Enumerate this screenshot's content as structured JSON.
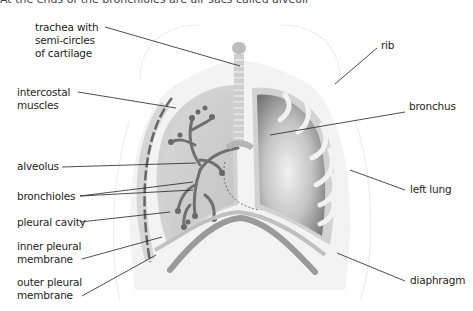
{
  "caption": "At the ends of the bronchioles are air sacs called alveoli",
  "labels": {
    "trachea": [
      "trachea with",
      "semi-circles",
      "of cartilage"
    ],
    "intercostal": [
      "intercostal",
      "muscles"
    ],
    "alveolus": [
      "alveolus"
    ],
    "bronchioles": [
      "bronchioles"
    ],
    "pleural_cavity": [
      "pleural cavity"
    ],
    "inner_pleural": [
      "inner pleural",
      "membrane"
    ],
    "outer_pleural": [
      "outer pleural",
      "membrane"
    ],
    "rib": [
      "rib"
    ],
    "bronchus": [
      "bronchus"
    ],
    "left_lung": [
      "left lung"
    ],
    "diaphragm": [
      "diaphragm"
    ]
  },
  "colors": {
    "body_outline": "#ededed",
    "lung_fill": "#c9c9c9",
    "lung_dark": "#7d7d7d",
    "membrane": "#a6a6a6",
    "bronchiole_tree": "#6e6e6e",
    "leader_line": "#231f20"
  }
}
